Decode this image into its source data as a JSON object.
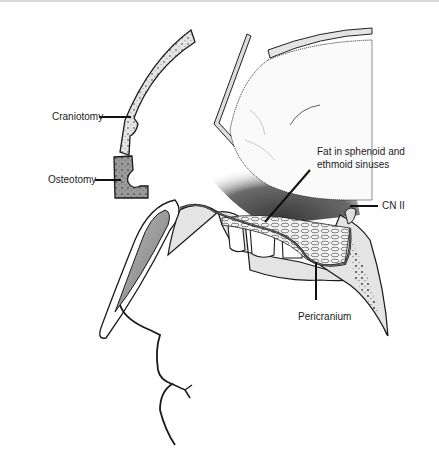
{
  "figure": {
    "labels": [
      {
        "id": "craniotomy",
        "text": "Craniotomy"
      },
      {
        "id": "osteotomy",
        "text": "Osteotomy"
      },
      {
        "id": "fat",
        "text_line1": "Fat in sphenoid and",
        "text_line2": "ethmoid sinuses"
      },
      {
        "id": "cn2",
        "text": "CN II"
      },
      {
        "id": "pericranium",
        "text": "Pericranium"
      }
    ],
    "colors": {
      "bone_fill": "#e4e4e4",
      "outline": "#1a1a1a",
      "osteotomy_fill": "#9a9a9a",
      "shadow_dark": "#555555",
      "background": "#ffffff"
    }
  }
}
